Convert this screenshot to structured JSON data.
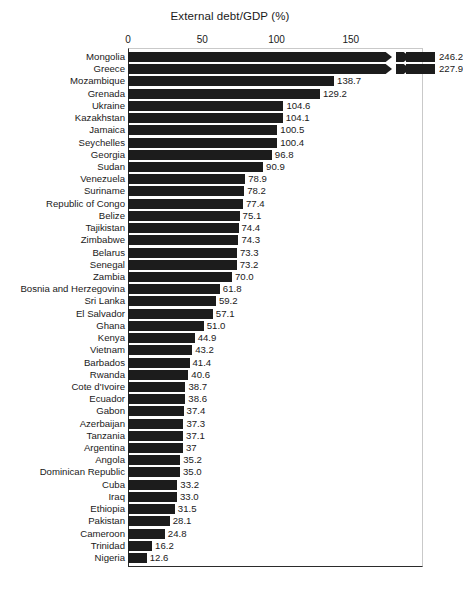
{
  "chart_data": {
    "type": "bar",
    "orientation": "horizontal",
    "title": "External debt/GDP (%)",
    "xlabel": "",
    "ylabel": "",
    "xlim": [
      0,
      180
    ],
    "xticks": [
      0,
      50,
      100,
      150
    ],
    "xtick_labels": [
      "0",
      "50",
      "100",
      "150"
    ],
    "grid": false,
    "legend": null,
    "bar_color": "#1c1c1c",
    "axis_break": {
      "enabled": true,
      "note": "Bars exceeding the axis maximum are drawn with a zigzag break near the right edge",
      "broken_categories": [
        "Mongolia",
        "Greece"
      ],
      "break_value": 168
    },
    "categories": [
      "Mongolia",
      "Greece",
      "Mozambique",
      "Grenada",
      "Ukraine",
      "Kazakhstan",
      "Jamaica",
      "Seychelles",
      "Georgia",
      "Sudan",
      "Venezuela",
      "Suriname",
      "Republic of Congo",
      "Belize",
      "Tajikistan",
      "Zimbabwe",
      "Belarus",
      "Senegal",
      "Zambia",
      "Bosnia and Herzegovina",
      "Sri Lanka",
      "El Salvador",
      "Ghana",
      "Kenya",
      "Vietnam",
      "Barbados",
      "Rwanda",
      "Cote d'Ivoire",
      "Ecuador",
      "Gabon",
      "Azerbaijan",
      "Tanzania",
      "Argentina",
      "Angola",
      "Dominican Republic",
      "Cuba",
      "Iraq",
      "Ethiopia",
      "Pakistan",
      "Cameroon",
      "Trinidad",
      "Nigeria"
    ],
    "values": [
      246.2,
      227.9,
      138.7,
      129.2,
      104.6,
      104.1,
      100.5,
      100.4,
      96.8,
      90.9,
      78.9,
      78.2,
      77.4,
      75.1,
      74.4,
      74.3,
      73.3,
      73.2,
      70.0,
      61.8,
      59.2,
      57.1,
      51.0,
      44.9,
      43.2,
      41.4,
      40.6,
      38.7,
      38.6,
      37.4,
      37.3,
      37.1,
      37,
      35.2,
      35.0,
      33.2,
      33.0,
      31.5,
      28.1,
      24.8,
      16.2,
      12.6
    ],
    "value_labels": [
      "246.2",
      "227.9",
      "138.7",
      "129.2",
      "104.6",
      "104.1",
      "100.5",
      "100.4",
      "96.8",
      "90.9",
      "78.9",
      "78.2",
      "77.4",
      "75.1",
      "74.4",
      "74.3",
      "73.3",
      "73.2",
      "70.0",
      "61.8",
      "59.2",
      "57.1",
      "51.0",
      "44.9",
      "43.2",
      "41.4",
      "40.6",
      "38.7",
      "38.6",
      "37.4",
      "37.3",
      "37.1",
      "37",
      "35.2",
      "35.0",
      "33.2",
      "33.0",
      "31.5",
      "28.1",
      "24.8",
      "16.2",
      "12.6"
    ]
  }
}
